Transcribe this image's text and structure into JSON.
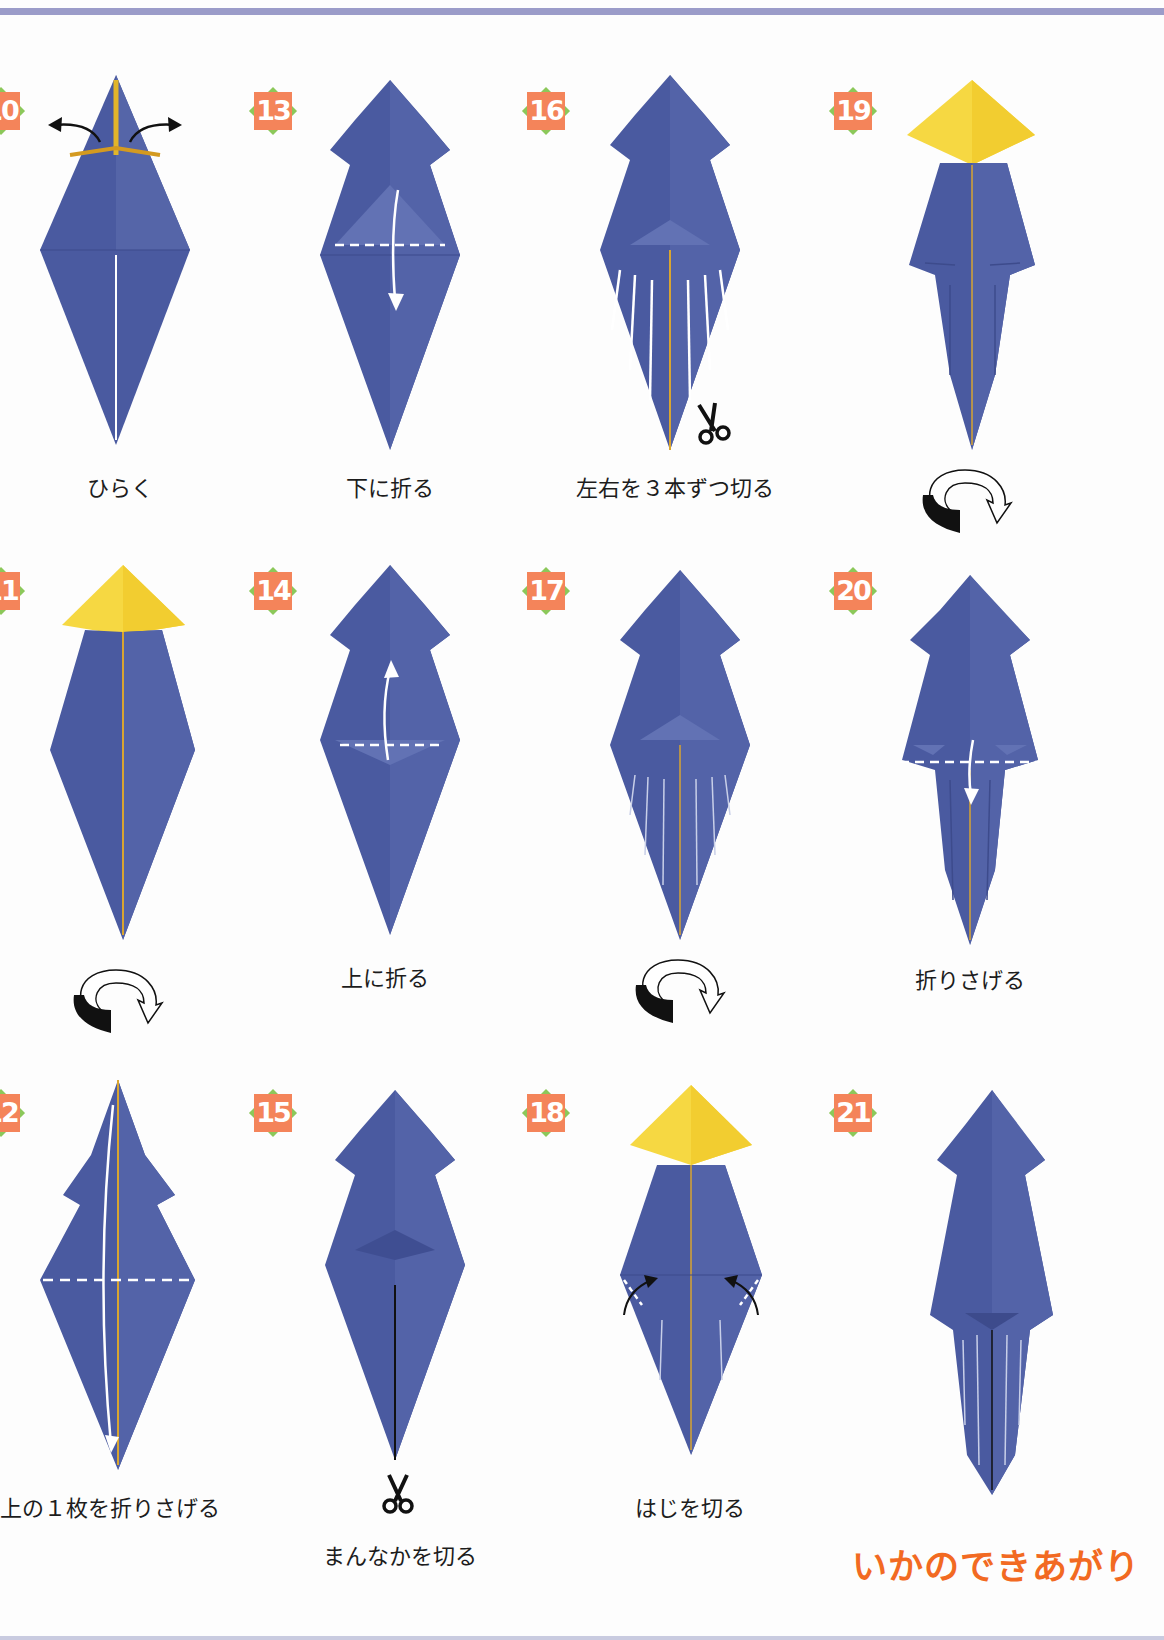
{
  "page": {
    "colors": {
      "paper_blue": "#4a5aa0",
      "paper_blue_light": "#5b6cb0",
      "paper_yellow": "#f6d842",
      "badge_orange": "#f4845a",
      "badge_green": "#8cc85a",
      "title_orange": "#f26a22",
      "rule": "#9b9cc9"
    }
  },
  "steps": [
    {
      "number": "10",
      "caption": "ひらく",
      "icons": [
        "arrow-left-icon",
        "arrow-right-icon"
      ]
    },
    {
      "number": "11",
      "caption": "",
      "icons": [
        "turn-over-icon"
      ]
    },
    {
      "number": "12",
      "caption": "上の１枚を折りさげる",
      "icons": [
        "fold-down-arrow-icon"
      ]
    },
    {
      "number": "13",
      "caption": "下に折る",
      "icons": [
        "fold-down-arrow-icon"
      ]
    },
    {
      "number": "14",
      "caption": "上に折る",
      "icons": [
        "fold-up-arrow-icon"
      ]
    },
    {
      "number": "15",
      "caption": "まんなかを切る",
      "icons": [
        "scissors-icon"
      ]
    },
    {
      "number": "16",
      "caption": "左右を３本ずつ切る",
      "icons": [
        "scissors-icon"
      ]
    },
    {
      "number": "17",
      "caption": "",
      "icons": [
        "turn-over-icon"
      ]
    },
    {
      "number": "18",
      "caption": "はじを切る",
      "icons": [
        "fold-arrow-icon"
      ]
    },
    {
      "number": "19",
      "caption": "",
      "icons": [
        "turn-over-icon"
      ]
    },
    {
      "number": "20",
      "caption": "折りさげる",
      "icons": [
        "fold-down-arrow-icon"
      ]
    },
    {
      "number": "21",
      "caption": "",
      "icons": []
    }
  ],
  "finish_title": "いかのできあがり"
}
